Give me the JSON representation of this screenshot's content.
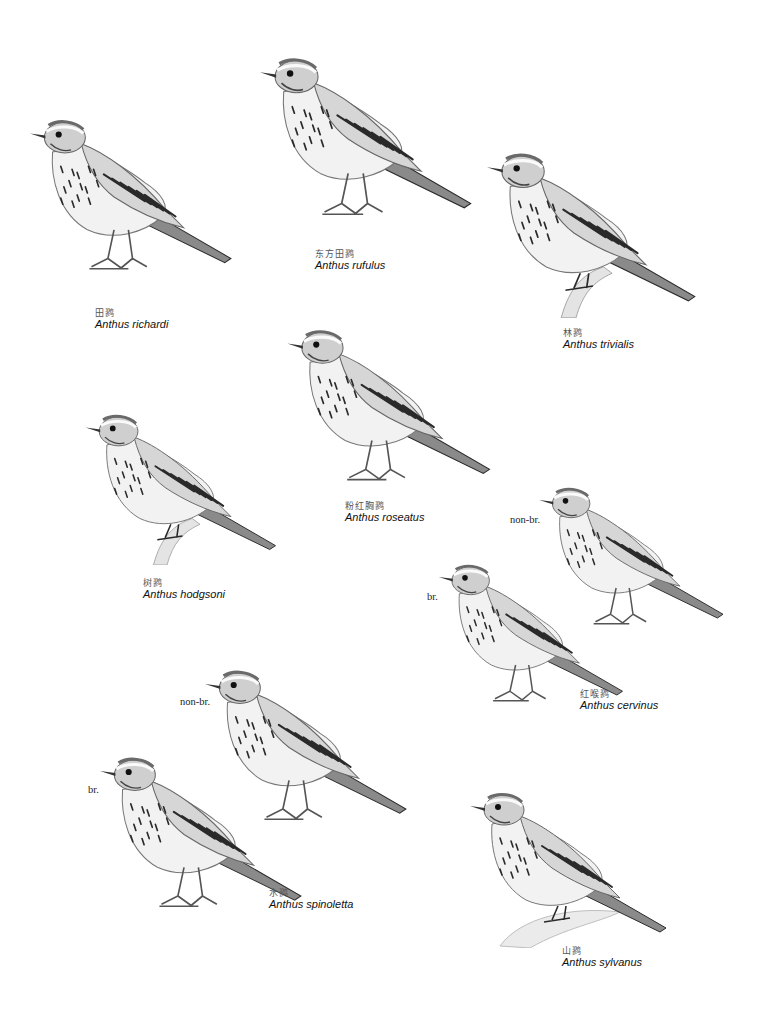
{
  "plate": {
    "title": "Plate of pipits (Anthus)",
    "birds": [
      {
        "id": "richardi",
        "zh": "田鹨",
        "sci": "Anthus richardi",
        "pose": "standing",
        "facing": "left",
        "perch": "ground",
        "box": {
          "x": 30,
          "y": 92,
          "w": 205,
          "h": 210
        },
        "caption": {
          "x": 95,
          "y": 308
        }
      },
      {
        "id": "rufulus",
        "zh": "东方田鹨",
        "sci": "Anthus rufulus",
        "pose": "standing",
        "facing": "left",
        "perch": "ground",
        "box": {
          "x": 260,
          "y": 44,
          "w": 215,
          "h": 190
        },
        "caption": {
          "x": 315,
          "y": 249
        }
      },
      {
        "id": "trivialis",
        "zh": "林鹨",
        "sci": "Anthus trivialis",
        "pose": "perched",
        "facing": "left",
        "perch": "branch",
        "box": {
          "x": 487,
          "y": 148,
          "w": 212,
          "h": 170
        },
        "caption": {
          "x": 563,
          "y": 328
        }
      },
      {
        "id": "roseatus",
        "zh": "粉红胸鹨",
        "sci": "Anthus roseatus",
        "pose": "standing",
        "facing": "left",
        "perch": "ground",
        "box": {
          "x": 287,
          "y": 325,
          "w": 207,
          "h": 165
        },
        "caption": {
          "x": 345,
          "y": 501
        }
      },
      {
        "id": "hodgsoni",
        "zh": "树鹨",
        "sci": "Anthus hodgsoni",
        "pose": "perched",
        "facing": "left",
        "perch": "branch",
        "box": {
          "x": 85,
          "y": 410,
          "w": 195,
          "h": 155
        },
        "caption": {
          "x": 143,
          "y": 578
        }
      },
      {
        "id": "cervinus-nonbr",
        "zh": "",
        "sci": "",
        "pose": "standing",
        "facing": "left",
        "perch": "ground",
        "plumage": "non-br.",
        "box": {
          "x": 533,
          "y": 483,
          "w": 200,
          "h": 150
        },
        "plumage_label": {
          "x": 510,
          "y": 514
        }
      },
      {
        "id": "cervinus-br",
        "zh": "红喉鹨",
        "sci": "Anthus cervinus",
        "pose": "standing",
        "facing": "left",
        "perch": "ground",
        "plumage": "br.",
        "box": {
          "x": 435,
          "y": 560,
          "w": 195,
          "h": 150
        },
        "caption": {
          "x": 580,
          "y": 689
        },
        "plumage_label": {
          "x": 427,
          "y": 591
        }
      },
      {
        "id": "spinoletta-nonbr",
        "zh": "",
        "sci": "",
        "pose": "standing",
        "facing": "left",
        "perch": "ground",
        "plumage": "non-br.",
        "box": {
          "x": 205,
          "y": 665,
          "w": 205,
          "h": 165
        },
        "plumage_label": {
          "x": 180,
          "y": 696
        }
      },
      {
        "id": "spinoletta-br",
        "zh": "水鹨",
        "sci": "Anthus spinoletta",
        "pose": "standing",
        "facing": "left",
        "perch": "ground",
        "plumage": "br.",
        "box": {
          "x": 100,
          "y": 752,
          "w": 205,
          "h": 165
        },
        "caption": {
          "x": 269,
          "y": 888
        },
        "plumage_label": {
          "x": 88,
          "y": 784
        }
      },
      {
        "id": "sylvanus",
        "zh": "山鹨",
        "sci": "Anthus sylvanus",
        "pose": "perched",
        "facing": "left",
        "perch": "rock",
        "box": {
          "x": 460,
          "y": 788,
          "w": 220,
          "h": 160
        },
        "caption": {
          "x": 562,
          "y": 946
        }
      }
    ]
  },
  "colors": {
    "background": "#ffffff",
    "plumage_dark": "#2a2a2a",
    "plumage_mid": "#8a8a8a",
    "plumage_light": "#d6d6d6",
    "belly": "#f2f2f2",
    "caption_zh": "#555555",
    "caption_sci": "#111111"
  }
}
